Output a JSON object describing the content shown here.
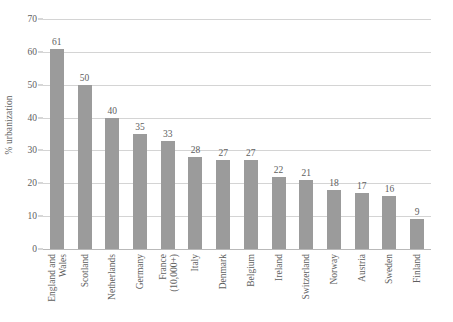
{
  "chart_data": {
    "type": "bar",
    "title": "",
    "subtitle": "",
    "xlabel": "",
    "ylabel": "% urbanization",
    "ylim": [
      0,
      70
    ],
    "yticks": [
      0,
      10,
      20,
      30,
      40,
      50,
      60,
      70
    ],
    "grid": true,
    "legend": false,
    "legend_position": "none",
    "orientation": "vertical",
    "bar_color": "#9b9b9b",
    "gridline_color": "#d4d4d4",
    "text_color": "#5e5e5e",
    "categories": [
      "England and Wales",
      "Scotland",
      "Netherlands",
      "Germany",
      "France (10,000+)",
      "Italy",
      "Denmark",
      "Belgium",
      "Ireland",
      "Switzerland",
      "Norway",
      "Austria",
      "Sweden",
      "Finland"
    ],
    "category_lines": [
      [
        "England and",
        "Wales"
      ],
      [
        "Scotland",
        ""
      ],
      [
        "Netherlands",
        ""
      ],
      [
        "Germany",
        ""
      ],
      [
        "France",
        "(10,000+)"
      ],
      [
        "Italy",
        ""
      ],
      [
        "Denmark",
        ""
      ],
      [
        "Belgium",
        ""
      ],
      [
        "Ireland",
        ""
      ],
      [
        "Switzerland",
        ""
      ],
      [
        "Norway",
        ""
      ],
      [
        "Austria",
        ""
      ],
      [
        "Sweden",
        ""
      ],
      [
        "Finland",
        ""
      ]
    ],
    "values": [
      61,
      50,
      40,
      35,
      33,
      28,
      27,
      27,
      22,
      21,
      18,
      17,
      16,
      9
    ],
    "value_labels": [
      "61",
      "50",
      "40",
      "35",
      "33",
      "28",
      "27",
      "27",
      "22",
      "21",
      "18",
      "17",
      "16",
      "9"
    ],
    "ytick_labels": [
      "0",
      "10",
      "20",
      "30",
      "40",
      "50",
      "60",
      "70"
    ]
  }
}
